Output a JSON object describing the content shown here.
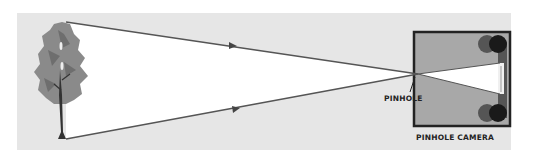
{
  "diagram": {
    "title": "",
    "labels": {
      "pinhole": "PINHOLE",
      "camera": "PINHOLE CAMERA"
    },
    "elements": [
      "tree",
      "light-rays",
      "pinhole",
      "camera-box",
      "inverted-image",
      "film-rollers"
    ],
    "colors": {
      "background": "#e6e6e6",
      "tree_foliage": "#8a8a8a",
      "trunk": "#333333",
      "ray_line": "#555555",
      "camera_body": "#a8a8a8",
      "camera_border": "#222222",
      "roller_dark": "#1a1a1a",
      "roller_mid": "#555555"
    }
  }
}
